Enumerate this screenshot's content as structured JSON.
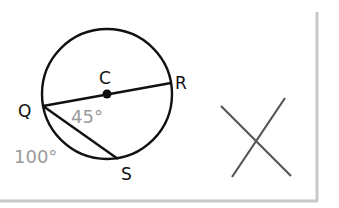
{
  "diagram": {
    "points": {
      "center": {
        "label": "C",
        "x": 107,
        "y": 94
      },
      "Q": {
        "label": "Q",
        "x": 42,
        "y": 106
      },
      "R": {
        "label": "R",
        "x": 171,
        "y": 84
      },
      "S": {
        "label": "S",
        "x": 118,
        "y": 159
      }
    },
    "circle": {
      "cx": 107,
      "cy": 94,
      "r": 65
    },
    "angle_label": "45°",
    "arc_label": "100°",
    "answer_mark": "X",
    "colors": {
      "stroke": "#111111",
      "measure_text": "#9a9a9a",
      "mark": "#555555",
      "border": "#c8c8c8"
    }
  }
}
